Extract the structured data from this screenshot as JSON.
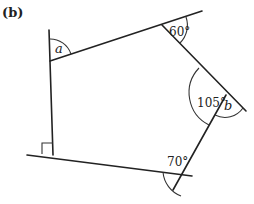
{
  "figure": {
    "part_label": "(b)",
    "shape": "pentagon",
    "angles": {
      "a": {
        "label": "a",
        "type": "unknown"
      },
      "top_right": {
        "label": "60°",
        "value": 60
      },
      "right_interior": {
        "label": "105°",
        "value": 105
      },
      "b": {
        "label": "b",
        "type": "unknown exterior"
      },
      "bottom_right": {
        "label": "70°",
        "value": 70
      },
      "bottom_left": {
        "label": "right angle",
        "value": 90
      }
    }
  }
}
